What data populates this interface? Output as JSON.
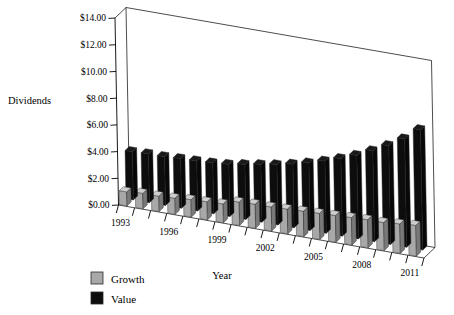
{
  "chart_data": {
    "type": "bar",
    "title": "",
    "xlabel": "Year",
    "ylabel": "Dividends",
    "ylim": [
      0,
      14
    ],
    "ytick_step": 2,
    "ytick_labels": [
      "$0.00",
      "$2.00",
      "$4.00",
      "$6.00",
      "$8.00",
      "$10.00",
      "$12.00",
      "$14.00"
    ],
    "ytick_values": [
      0,
      2,
      4,
      6,
      8,
      10,
      12,
      14
    ],
    "grid": false,
    "legend_position": "bottom-left",
    "projection": "3d",
    "categories": [
      "1993",
      "1994",
      "1995",
      "1996",
      "1997",
      "1998",
      "1999",
      "2000",
      "2001",
      "2002",
      "2003",
      "2004",
      "2005",
      "2006",
      "2007",
      "2008",
      "2009",
      "2010",
      "2011"
    ],
    "xtick_labels_shown": [
      "1993",
      "1996",
      "1999",
      "2002",
      "2005",
      "2008",
      "2011"
    ],
    "xtick_label_interval": 3,
    "series": [
      {
        "name": "Growth",
        "color": "#a8a8a8",
        "values": [
          1.05,
          1.15,
          1.15,
          1.2,
          1.3,
          1.35,
          1.4,
          1.75,
          1.8,
          1.8,
          1.85,
          1.9,
          1.95,
          2.0,
          2.05,
          2.1,
          2.1,
          2.2,
          2.3
        ]
      },
      {
        "name": "Value",
        "color": "#0d0d0d",
        "values": [
          3.6,
          3.65,
          3.65,
          3.7,
          3.75,
          3.8,
          3.9,
          4.1,
          4.3,
          4.5,
          4.75,
          5.05,
          5.4,
          5.8,
          6.25,
          6.8,
          7.4,
          8.1,
          9.0
        ]
      }
    ]
  },
  "legend": {
    "items": [
      {
        "label": "Growth",
        "swatch": "#a8a8a8"
      },
      {
        "label": "Value",
        "swatch": "#0d0d0d"
      }
    ]
  },
  "axes": {
    "y_title": "Dividends",
    "x_title": "Year"
  }
}
